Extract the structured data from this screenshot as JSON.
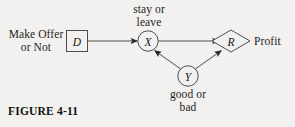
{
  "figure": {
    "caption": "FIGURE 4-11",
    "background_color": "#f2f1ef",
    "line_color": "#4a4a4a",
    "text_color": "#1a1a1a"
  },
  "diagram": {
    "type": "influence-diagram",
    "nodes": [
      {
        "id": "D",
        "letter": "D",
        "shape": "square",
        "role": "decision",
        "label": "Make Offer\nor Not",
        "label_line1": "Make Offer",
        "label_line2": "or Not",
        "label_position": "left",
        "x": 77,
        "y": 41
      },
      {
        "id": "X",
        "letter": "X",
        "shape": "circle",
        "role": "chance",
        "label": "stay or\nleave",
        "label_line1": "stay or",
        "label_line2": "leave",
        "label_position": "above",
        "x": 148,
        "y": 41
      },
      {
        "id": "Y",
        "letter": "Y",
        "shape": "circle",
        "role": "chance",
        "label": "good or\nbad",
        "label_line1": "good or",
        "label_line2": "bad",
        "label_position": "below",
        "x": 188,
        "y": 76
      },
      {
        "id": "R",
        "letter": "R",
        "shape": "diamond",
        "role": "value",
        "label": "Profit",
        "label_position": "right",
        "x": 231,
        "y": 41
      }
    ],
    "edges": [
      {
        "from": "D",
        "to": "X",
        "arrowhead": "solid"
      },
      {
        "from": "X",
        "to": "R",
        "arrowhead": "solid"
      },
      {
        "from": "Y",
        "to": "X",
        "arrowhead": "solid"
      },
      {
        "from": "Y",
        "to": "R",
        "arrowhead": "solid"
      }
    ]
  }
}
